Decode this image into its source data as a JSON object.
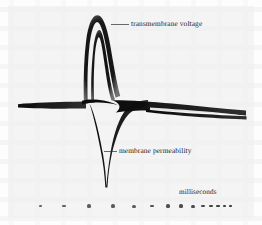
{
  "figure": {
    "kind": "oscilloscope-trace-photograph",
    "background_color": "#fdfdfd",
    "ink_color": "#141414",
    "annotations": {
      "voltage_label": "transmembrane voltage",
      "permeability_label": "membrane permeability",
      "axis_label": "milliseconds"
    }
  },
  "chart_data": {
    "type": "line",
    "title": "",
    "subtitle": "",
    "xlabel": "milliseconds",
    "ylabel": "",
    "grid": false,
    "legend": "inline-annotations",
    "axis_note": "time axis marked only by a row of tick dots whose spacing compresses toward the right, indicating a logarithmic-like or accelerating time scale",
    "xlim": [
      0,
      10
    ],
    "ylim": [
      -1.6,
      1.25
    ],
    "annotations": [
      {
        "text": "transmembrane voltage",
        "target_x": 3.3,
        "target_y": 1.0,
        "leader": true,
        "position": "upper-right-of-peak"
      },
      {
        "text": "membrane permeability",
        "target_x": 3.35,
        "target_y": -0.62,
        "leader": true,
        "position": "right-of-descending-spike"
      },
      {
        "text": "milliseconds",
        "position": "lower-right",
        "leader": false
      }
    ],
    "series": [
      {
        "name": "transmembrane voltage",
        "description": "flat baseline at rest, sharp rapid upstroke to a narrow rounded peak, then a fast repolarizing fall back through baseline",
        "color": "#141414",
        "x": [
          0.0,
          0.6,
          1.2,
          1.8,
          2.3,
          2.65,
          2.85,
          3.0,
          3.1,
          3.2,
          3.35,
          3.5,
          3.7,
          3.95,
          4.3,
          4.8,
          5.6,
          6.6,
          7.8,
          9.0,
          10.0
        ],
        "y": [
          0.0,
          0.0,
          0.0,
          0.0,
          0.02,
          0.12,
          0.42,
          0.82,
          1.0,
          1.06,
          1.02,
          0.9,
          0.66,
          0.4,
          0.2,
          0.07,
          0.01,
          0.0,
          0.0,
          0.0,
          0.0
        ]
      },
      {
        "name": "transmembrane voltage (inner repeat trace)",
        "description": "second superimposed sweep tracing just inside the first, giving the doubled outline of the peak",
        "color": "#141414",
        "x": [
          0.0,
          1.2,
          2.3,
          2.7,
          2.95,
          3.1,
          3.25,
          3.45,
          3.7,
          4.0,
          4.5,
          5.2,
          6.2,
          7.5,
          10.0
        ],
        "y": [
          0.0,
          0.0,
          0.03,
          0.2,
          0.62,
          0.88,
          0.9,
          0.76,
          0.54,
          0.33,
          0.15,
          0.05,
          0.0,
          0.0,
          0.0
        ]
      },
      {
        "name": "membrane permeability",
        "description": "deflects sharply downward at the moment of the spike, reaching a deep narrow minimum, then relaxes back toward baseline forming a long tapering wedge",
        "color": "#141414",
        "x": [
          0.0,
          1.0,
          2.0,
          2.6,
          2.9,
          3.05,
          3.15,
          3.3,
          3.45,
          3.6,
          3.9,
          4.3,
          5.0,
          5.9,
          7.0,
          8.2,
          9.2,
          10.0
        ],
        "y": [
          0.0,
          0.0,
          -0.01,
          -0.06,
          -0.3,
          -0.75,
          -1.2,
          -1.52,
          -1.2,
          -0.85,
          -0.5,
          -0.3,
          -0.16,
          -0.09,
          -0.05,
          -0.03,
          -0.02,
          -0.01
        ]
      },
      {
        "name": "lower envelope (return sweep)",
        "description": "broad dark band beneath the baseline on the right that narrows into a thin line, closing the lens-shaped gap",
        "color": "#141414",
        "x": [
          3.6,
          4.2,
          5.0,
          6.0,
          7.0,
          8.0,
          9.0,
          10.0
        ],
        "y": [
          -0.55,
          -0.34,
          -0.22,
          -0.15,
          -0.12,
          -0.1,
          -0.09,
          -0.08
        ]
      }
    ],
    "tick_marks": {
      "description": "row of dot-shaped timing marks below the trace; spacing narrows and dot size varies toward the right",
      "count": 14,
      "x_positions_px": [
        40,
        64,
        89,
        113,
        134,
        152,
        168,
        181,
        193,
        203,
        211,
        218,
        224,
        230
      ],
      "widths_px": [
        3,
        3.4,
        4.4,
        4.6,
        4.2,
        3.8,
        4.0,
        4.0,
        3.8,
        3.6,
        3.4,
        3.2,
        3.0,
        3.0
      ],
      "heights_px": [
        2.2,
        2.6,
        3.4,
        3.4,
        3.0,
        2.8,
        3.2,
        3.2,
        3.0,
        2.8,
        2.8,
        2.6,
        2.6,
        2.6
      ]
    }
  }
}
